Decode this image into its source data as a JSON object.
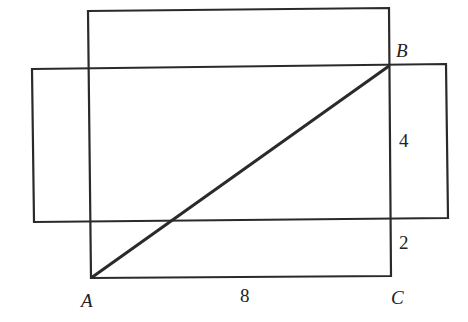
{
  "diagram": {
    "points": {
      "A": "A",
      "B": "B",
      "C": "C"
    },
    "measurements": {
      "AC": "8",
      "upper_segment": "4",
      "lower_segment": "2"
    },
    "colors": {
      "stroke": "#2a2a2a",
      "background": "#ffffff"
    }
  }
}
